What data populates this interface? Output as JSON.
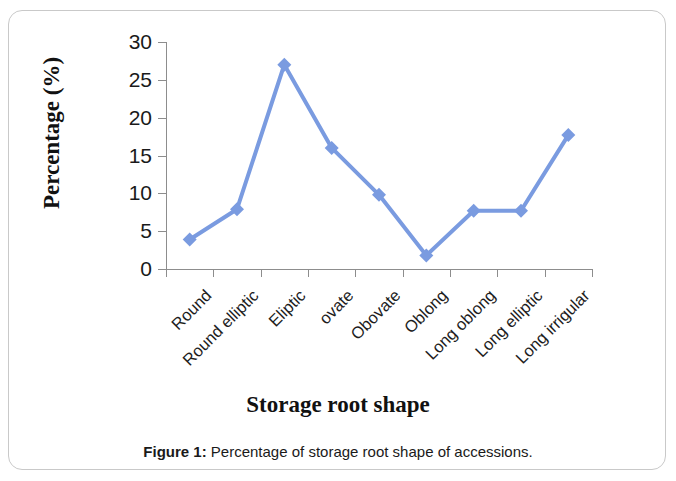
{
  "figure": {
    "caption_label": "Figure 1:",
    "caption_text": " Percentage of storage root shape of accessions."
  },
  "chart_data": {
    "type": "line",
    "title": "",
    "xlabel": "Storage root shape",
    "ylabel": "Percentage (%)",
    "categories": [
      "Round",
      "Round elliptic",
      "Eliptic",
      "ovate",
      "Obovate",
      "Oblong",
      "Long oblong",
      "Long elliptic",
      "Long irrigular"
    ],
    "values": [
      3.9,
      7.9,
      27.0,
      16.0,
      9.8,
      1.8,
      7.7,
      7.7,
      17.7
    ],
    "ylim": [
      0,
      30
    ],
    "ytick_labels": [
      "0",
      "5",
      "10",
      "15",
      "20",
      "25",
      "30"
    ],
    "ytick_values": [
      0,
      5,
      10,
      15,
      20,
      25,
      30
    ],
    "grid": false,
    "legend": false,
    "legend_position": "none",
    "series_color": "#7A9BE0",
    "marker": "diamond",
    "axis_color": "#8D8D8D"
  }
}
